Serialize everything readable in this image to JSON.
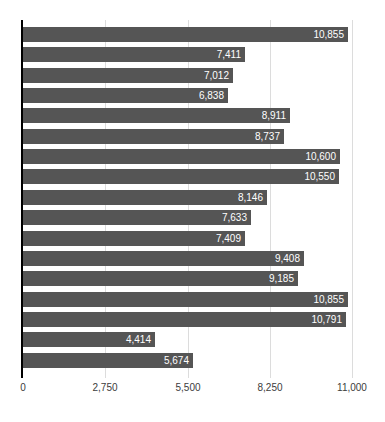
{
  "chart_data": {
    "type": "bar",
    "orientation": "horizontal",
    "title": "",
    "subtitle": "",
    "xlabel": "",
    "ylabel": "",
    "xlim": [
      0,
      11000
    ],
    "xticks": [
      0,
      2750,
      5500,
      8250,
      11000
    ],
    "xtick_labels": [
      "0",
      "2,750",
      "5,500",
      "8,250",
      "11,000"
    ],
    "grid": true,
    "grid_axis": "x",
    "legend": false,
    "categories": [
      "",
      "",
      "",
      "",
      "",
      "",
      "",
      "",
      "",
      "",
      "",
      "",
      "",
      "",
      "",
      "",
      ""
    ],
    "values": [
      10855,
      7411,
      7012,
      6838,
      8911,
      8737,
      10600,
      10550,
      8146,
      7633,
      7409,
      9408,
      9185,
      10855,
      10791,
      4414,
      5674
    ],
    "data_labels": [
      "10,855",
      "7,411",
      "7,012",
      "6,838",
      "8,911",
      "8,737",
      "10,600",
      "10,550",
      "8,146",
      "7,633",
      "7,409",
      "9,408",
      "9,185",
      "10,855",
      "10,791",
      "4,414",
      "5,674"
    ],
    "bar_color": "#555555",
    "label_color": "#ffffff",
    "gridline_color": "#dcdcdc",
    "axis_color": "#000000",
    "background_color": "#ffffff"
  }
}
